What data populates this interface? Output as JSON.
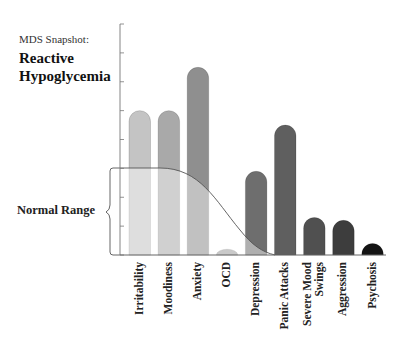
{
  "header": {
    "subtitle": "MDS Snapshot:",
    "title_line1": "Reactive",
    "title_line2": "Hypoglycemia"
  },
  "annotation": {
    "normal_range_label": "Normal Range"
  },
  "chart_data": {
    "type": "bar",
    "title": "Reactive Hypoglycemia",
    "subtitle": "MDS Snapshot:",
    "xlabel": "",
    "ylabel": "",
    "categories": [
      "Irritability",
      "Moodiness",
      "Anxiety",
      "OCD",
      "Depression",
      "Panic Attacks",
      "Severe Mood Swings",
      "Aggression",
      "Psychosis"
    ],
    "values": [
      5,
      5,
      6.5,
      0.2,
      2.9,
      4.5,
      1.3,
      1.2,
      0.4
    ],
    "ylim": [
      0,
      8
    ],
    "y_ticks": 8,
    "grid": false,
    "legend": "none",
    "bar_colors": [
      "#c4c4c4",
      "#a9a9a9",
      "#8f8f8f",
      "#9d9d9d",
      "#6e6e6e",
      "#5f5f5f",
      "#505050",
      "#3d3d3d",
      "#141414"
    ],
    "annotations": [
      {
        "text": "Normal Range",
        "type": "bracket+curve",
        "range_y": [
          0,
          3.1
        ]
      }
    ]
  }
}
